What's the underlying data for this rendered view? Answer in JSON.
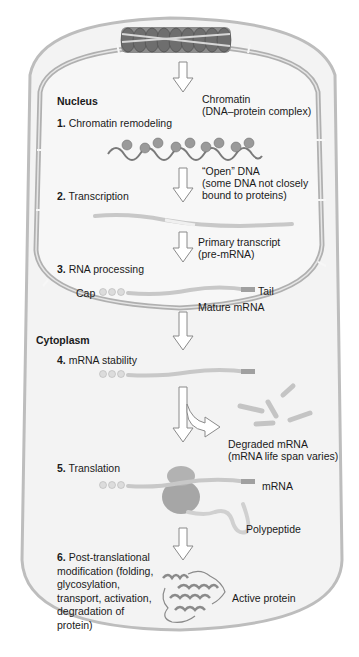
{
  "regions": {
    "nucleus": "Nucleus",
    "cytoplasm": "Cytoplasm"
  },
  "steps": [
    {
      "number": "1.",
      "label": "Chromatin remodeling"
    },
    {
      "number": "2.",
      "label": "Transcription"
    },
    {
      "number": "3.",
      "label": "RNA processing"
    },
    {
      "number": "4.",
      "label": "mRNA stability"
    },
    {
      "number": "5.",
      "label": "Translation"
    },
    {
      "number": "6.",
      "label_lines": [
        "Post-translational",
        "modification (folding,",
        "glycosylation,",
        "transport, activation,",
        "degradation of",
        "protein)"
      ]
    }
  ],
  "annotations": {
    "chromatin": [
      "Chromatin",
      "(DNA–protein complex)"
    ],
    "open_dna": [
      "“Open” DNA",
      "(some DNA not closely",
      "bound to proteins)"
    ],
    "primary_transcript": [
      "Primary transcript",
      "(pre-mRNA)"
    ],
    "cap": "Cap",
    "tail": "Tail",
    "mature_mrna": "Mature mRNA",
    "degraded_mrna": [
      "Degraded mRNA",
      "(mRNA life span varies)"
    ],
    "mrna": "mRNA",
    "polypeptide": "Polypeptide",
    "active_protein": "Active protein"
  },
  "colors": {
    "cell_fill": "#f2f2f2",
    "membrane": "#b8b8b8",
    "nucleus_fill": "#f6f6f6",
    "strand": "#c9c9c9",
    "ribosome": "#a8a8a8",
    "text": "#1a1a1a"
  }
}
